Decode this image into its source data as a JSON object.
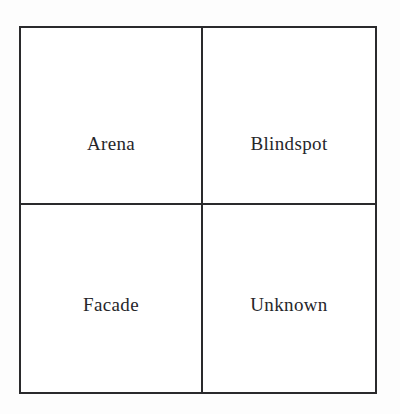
{
  "figure": {
    "type": "2x2-matrix",
    "background_color": "#fdfdfd",
    "line_color": "#2a2a2c",
    "text_color": "#26262a",
    "quadrants": [
      {
        "id": "arena",
        "position": "top-left",
        "label": "Arena"
      },
      {
        "id": "blindspot",
        "position": "top-right",
        "label": "Blindspot"
      },
      {
        "id": "facade",
        "position": "bottom-left",
        "label": "Facade"
      },
      {
        "id": "unknown",
        "position": "bottom-right",
        "label": "Unknown"
      }
    ]
  }
}
